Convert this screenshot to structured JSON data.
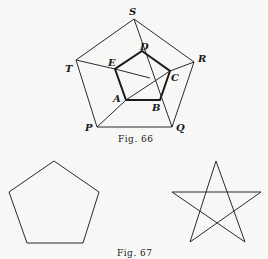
{
  "figure66": {
    "caption": "Fig. 66",
    "outer_labels": [
      "S",
      "R",
      "Q",
      "P",
      "T"
    ],
    "inner_labels": [
      "D",
      "C",
      "B",
      "A",
      "E"
    ]
  },
  "figure67": {
    "caption": "Fig. 67",
    "shapes": [
      "regular pentagon",
      "pentagram star"
    ]
  }
}
